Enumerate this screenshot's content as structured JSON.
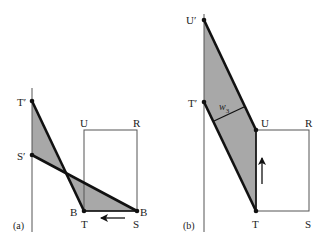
{
  "colors": {
    "shade": "#a8a8a8",
    "line": "#111111",
    "thin": "#555555",
    "background": "#ffffff"
  },
  "panel_a": {
    "caption": "(a)",
    "labels": {
      "t_prime": "T′",
      "s_prime": "S′",
      "u": "U",
      "r": "R",
      "b_left": "B",
      "b_right": "B",
      "t": "T",
      "s": "S"
    },
    "arrow_direction": "left"
  },
  "panel_b": {
    "caption": "(b)",
    "labels": {
      "u_prime": "U′",
      "t_prime": "T′",
      "w3_base": "w",
      "w3_sub": "3",
      "u": "U",
      "r": "R",
      "t": "T",
      "s": "S"
    },
    "arrow_direction": "up"
  }
}
